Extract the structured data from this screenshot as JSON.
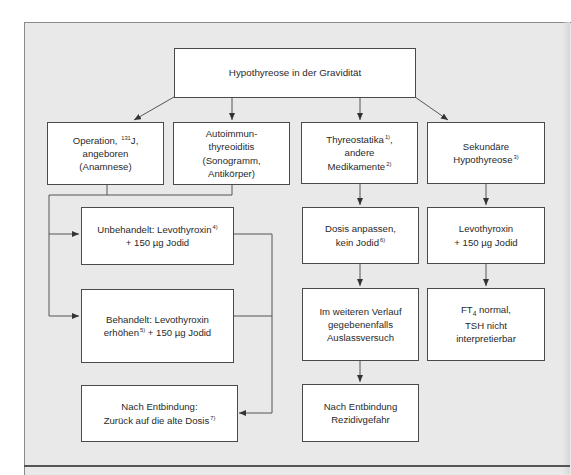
{
  "diagram": {
    "title": "Hypothyreose in der Gravidität",
    "nodes": {
      "operation": {
        "line1_pre": "Operation, ",
        "line1_sup": "131",
        "line1_post": "J,",
        "line2": "angeboren",
        "line3": "(Anamnese)"
      },
      "autoimmun": {
        "line1": "Autoimmun-",
        "line2": "thyreoiditis",
        "line3": "(Sonogramm,",
        "line4": "Antikörper)"
      },
      "thyreostatika": {
        "line1": "Thyreostatika",
        "line1_sup": "1)",
        "line1_post": ",",
        "line2": "andere",
        "line3": "Medikamente",
        "line3_sup": "2)"
      },
      "sekundaer": {
        "line1": "Sekundäre",
        "line2": "Hypothyreose",
        "line2_sup": "3)"
      },
      "unbehandelt": {
        "line1": "Unbehandelt: Levothyroxin",
        "line1_sup": "4)",
        "line2": "+ 150 µg Jodid"
      },
      "behandelt": {
        "line1": "Behandelt: Levothyroxin",
        "line2_pre": "erhöhen",
        "line2_sup": "5)",
        "line2_post": " + 150 µg Jodid"
      },
      "nach_entbindung_dosis": {
        "line1": "Nach Entbindung:",
        "line2": "Zurück auf die alte Dosis",
        "line2_sup": "7)"
      },
      "dosis_anpassen": {
        "line1": "Dosis anpassen,",
        "line2": "kein Jodid",
        "line2_sup": "6)"
      },
      "auslassversuch": {
        "line1": "Im weiteren Verlauf",
        "line2": "gegebenenfalls",
        "line3": "Auslassversuch"
      },
      "rezidiv": {
        "line1": "Nach Entbindung",
        "line2": "Rezidivgefahr"
      },
      "levothyroxin": {
        "line1": "Levothyroxin",
        "line2": "+ 150 µg Jodid"
      },
      "ft4": {
        "line1_pre": "FT",
        "line1_sub": "4",
        "line1_post": " normal,",
        "line2": "TSH nicht",
        "line3": "interpretierbar"
      }
    },
    "colors": {
      "background": "#e9e9e9",
      "box_fill": "#ffffff",
      "line": "#4a4a4a"
    }
  }
}
